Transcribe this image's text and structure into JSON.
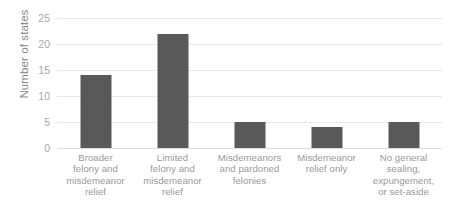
{
  "chart_data": {
    "type": "bar",
    "title": "",
    "xlabel": "",
    "ylabel": "Number of states",
    "categories": [
      "Broader felony and misdemeanor relief",
      "Limited felony and misdemeanor relief",
      "Misdemeanors and pardoned felonies",
      "Misdemeanor relief only",
      "No general sealing, expungement, or set-aside"
    ],
    "values": [
      14,
      22,
      5,
      4,
      5
    ],
    "ylim": [
      0,
      25
    ],
    "yticks": [
      0,
      5,
      10,
      15,
      20,
      25
    ],
    "ytick_labels": [
      "0",
      "5",
      "10",
      "15",
      "20",
      "25"
    ],
    "grid": true,
    "legend": false,
    "bar_color": "#595959",
    "gridline_color": "#e8e8e8",
    "text_color": "#9a9a9a"
  },
  "axis": {
    "y_title": "Number of states"
  },
  "categories_wrapped": [
    [
      "Broader",
      "felony and",
      "misdemeanor",
      "relief"
    ],
    [
      "Limited",
      "felony and",
      "misdemeanor",
      "relief"
    ],
    [
      "Misdemeanors",
      "and pardoned",
      "felonies"
    ],
    [
      "Misdemeanor",
      "relief only"
    ],
    [
      "No general",
      "sealing,",
      "expungement,",
      "or set-aside"
    ]
  ]
}
